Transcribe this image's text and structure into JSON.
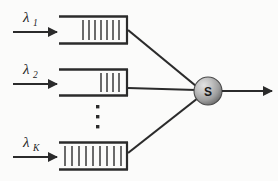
{
  "figure": {
    "type": "queueing-network-diagram",
    "background_color": "#fbfbfa",
    "line_color": "#2b2b2b"
  },
  "arrivals": [
    {
      "label": "λ",
      "subscript": "1",
      "name": "lambda-1"
    },
    {
      "label": "λ",
      "subscript": "2",
      "name": "lambda-2"
    },
    {
      "label": "λ",
      "subscript": "K",
      "name": "lambda-K"
    }
  ],
  "queues": [
    {
      "id": "queue-1",
      "jobs": 7,
      "fill": "right-aligned"
    },
    {
      "id": "queue-2",
      "jobs": 4,
      "fill": "right-aligned"
    },
    {
      "id": "queue-K",
      "jobs": 9,
      "fill": "full"
    }
  ],
  "server": {
    "label": "S",
    "name": "server-node",
    "shape": "sphere",
    "color_light": "#d8d8d8",
    "color_mid": "#a9a9a9",
    "color_dark": "#6e6e6e"
  },
  "ellipsis": {
    "name": "vertical-ellipsis",
    "dots": 3,
    "glyph": "▪"
  },
  "departure": {
    "name": "departure-arrow",
    "label": ""
  }
}
